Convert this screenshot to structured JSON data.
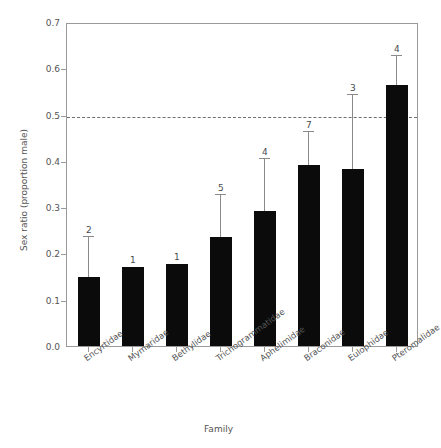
{
  "chart_data": {
    "type": "bar",
    "title": "",
    "xlabel": "Family",
    "ylabel": "Sex ratio (proportion male)",
    "ylim": [
      0.0,
      0.7
    ],
    "ytick_labels": [
      "0.0",
      "0.1",
      "0.2",
      "0.3",
      "0.4",
      "0.5",
      "0.6",
      "0.7"
    ],
    "ytick_values": [
      0.0,
      0.1,
      0.2,
      0.3,
      0.4,
      0.5,
      0.6,
      0.7
    ],
    "grid": false,
    "legend": "none",
    "reference_line": {
      "value": 0.5,
      "style": "dashed",
      "color": "#6f6f6f"
    },
    "bar_color": "#0b0b0b",
    "errorbar_color": "#8a8a8a",
    "categories": [
      "Encyrtidae",
      "Mymaridae",
      "Bethylidae",
      "Trichogrammatidae",
      "Aphelimidae",
      "Braconidae",
      "Eulophidae",
      "Pteromalidae"
    ],
    "values": [
      0.149,
      0.171,
      0.178,
      0.235,
      0.292,
      0.391,
      0.382,
      0.565
    ],
    "error_upper": [
      0.235,
      null,
      null,
      0.326,
      0.405,
      0.462,
      0.542,
      0.626
    ],
    "annotations": [
      "2",
      "1",
      "1",
      "5",
      "4",
      "7",
      "3",
      "4"
    ],
    "annotation_meaning": "sample size n above each bar"
  }
}
